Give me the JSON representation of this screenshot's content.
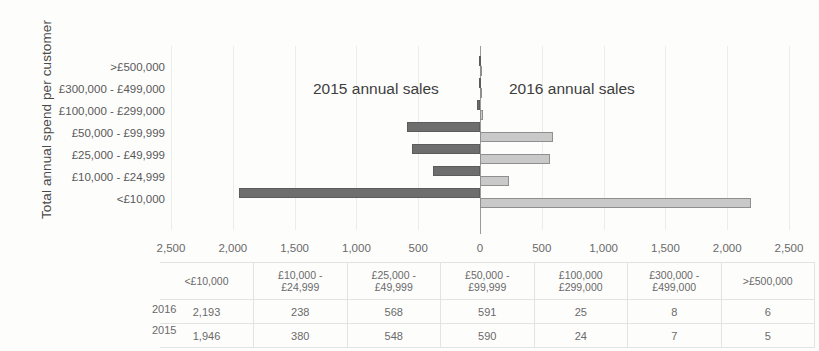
{
  "axis_title": "Total annual spend per customer",
  "legend": {
    "left_label": "2015 annual sales",
    "right_label": "2016 annual sales"
  },
  "colors": {
    "series_2015": "#6e6e6e",
    "series_2016": "#c9c9c9",
    "axis": "#9b9b9b",
    "grid": "#ececeb",
    "text": "#5b5b5b"
  },
  "xticks": [
    {
      "label": "2,500",
      "value": -2500
    },
    {
      "label": "2,000",
      "value": -2000
    },
    {
      "label": "1,500",
      "value": -1500
    },
    {
      "label": "1,000",
      "value": -1000
    },
    {
      "label": "500",
      "value": -500
    },
    {
      "label": "0",
      "value": 0
    },
    {
      "label": "500",
      "value": 500
    },
    {
      "label": "1,000",
      "value": 1000
    },
    {
      "label": "1,500",
      "value": 1500
    },
    {
      "label": "2,000",
      "value": 2000
    },
    {
      "label": "2,500",
      "value": 2500
    }
  ],
  "categories_axis": [
    ">£500,000",
    "£300,000 - £499,000",
    "£100,000 - £299,000",
    "£50,000 - £99,999",
    "£25,000 - £49,999",
    "£10,000 - £24,999",
    "<£10,000"
  ],
  "table": {
    "row_labels": [
      "2016",
      "2015"
    ],
    "headers": [
      "<£10,000",
      "£10,000 - £24,999",
      "£25,000 - £49,999",
      "£50,000 - £99,999",
      "£100,000 £299,000",
      "£300,000 - £499,000",
      ">£500,000"
    ],
    "headers_lines": [
      [
        "<£10,000",
        ""
      ],
      [
        "£10,000 -",
        "£24,999"
      ],
      [
        "£25,000 -",
        "£49,999"
      ],
      [
        "£50,000 -",
        "£99,999"
      ],
      [
        "£100,000",
        "£299,000"
      ],
      [
        "£300,000 -",
        "£499,000"
      ],
      [
        ">£500,000",
        ""
      ]
    ],
    "rows": [
      {
        "year": "2016",
        "values": [
          "2,193",
          "238",
          "568",
          "591",
          "25",
          "8",
          "6"
        ]
      },
      {
        "year": "2015",
        "values": [
          "1,946",
          "380",
          "548",
          "590",
          "24",
          "7",
          "5"
        ]
      }
    ]
  },
  "chart_data": {
    "type": "bar",
    "orientation": "horizontal",
    "style": "tornado",
    "title": "",
    "xlabel": "",
    "ylabel": "Total annual spend per customer",
    "xlim": [
      -2500,
      2500
    ],
    "xtick_values": [
      -2500,
      -2000,
      -1500,
      -1000,
      -500,
      0,
      500,
      1000,
      1500,
      2000,
      2500
    ],
    "xtick_labels": [
      "2,500",
      "2,000",
      "1,500",
      "1,000",
      "500",
      "0",
      "500",
      "1,000",
      "1,500",
      "2,000",
      "2,500"
    ],
    "grid": true,
    "legend_position": "inside-top",
    "categories": [
      ">£500,000",
      "£300,000 - £499,000",
      "£100,000 - £299,000",
      "£50,000 - £99,999",
      "£25,000 - £49,999",
      "£10,000 - £24,999",
      "<£10,000"
    ],
    "series": [
      {
        "name": "2015 annual sales",
        "direction": "left",
        "values": [
          5,
          7,
          24,
          590,
          548,
          380,
          1946
        ]
      },
      {
        "name": "2016 annual sales",
        "direction": "right",
        "values": [
          6,
          8,
          25,
          591,
          568,
          238,
          2193
        ]
      }
    ]
  }
}
